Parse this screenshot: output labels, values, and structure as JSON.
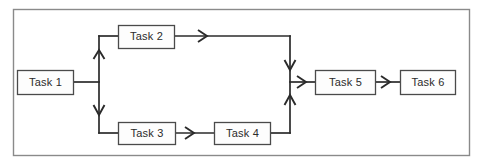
{
  "diagram": {
    "type": "flowchart",
    "frame": {
      "color": "#8a8a8a"
    },
    "line_color": "#2b2b2b",
    "box_border_color": "#4a4a4a",
    "box_fill_color": "#fdfdfd",
    "nodes": [
      {
        "id": "task1",
        "label": "Task 1",
        "x": 17,
        "y": 70,
        "w": 56,
        "h": 24
      },
      {
        "id": "task2",
        "label": "Task 2",
        "x": 118,
        "y": 25,
        "w": 56,
        "h": 23
      },
      {
        "id": "task3",
        "label": "Task 3",
        "x": 118,
        "y": 122,
        "w": 57,
        "h": 22
      },
      {
        "id": "task4",
        "label": "Task 4",
        "x": 214,
        "y": 122,
        "w": 56,
        "h": 22
      },
      {
        "id": "task5",
        "label": "Task 5",
        "x": 315,
        "y": 70,
        "w": 60,
        "h": 24
      },
      {
        "id": "task6",
        "label": "Task 6",
        "x": 400,
        "y": 70,
        "w": 55,
        "h": 24
      }
    ],
    "edges": [
      {
        "from": "task1",
        "to": "split",
        "kind": "horizontal"
      },
      {
        "from": "split",
        "to": "task2",
        "kind": "branch-up"
      },
      {
        "from": "split",
        "to": "task3",
        "kind": "branch-down"
      },
      {
        "from": "task2",
        "to": "merge",
        "kind": "horizontal-then-down"
      },
      {
        "from": "task3",
        "to": "task4",
        "kind": "horizontal"
      },
      {
        "from": "task4",
        "to": "merge",
        "kind": "horizontal-then-up"
      },
      {
        "from": "merge",
        "to": "task5",
        "kind": "horizontal"
      },
      {
        "from": "task5",
        "to": "task6",
        "kind": "horizontal"
      }
    ],
    "junctions": {
      "split_x": 99,
      "merge_x": 290,
      "main_y": 82,
      "top_y": 36,
      "bottom_y": 133
    }
  }
}
